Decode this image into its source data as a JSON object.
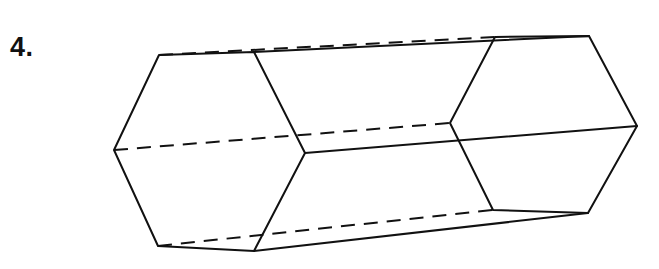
{
  "label": {
    "problem_number": "4."
  },
  "figure": {
    "type": "hexagonal-prism",
    "stroke_color": "#111111",
    "front_hexagon": [
      [
        159,
        55
      ],
      [
        254,
        52
      ],
      [
        305,
        153
      ],
      [
        254,
        251
      ],
      [
        158,
        246
      ],
      [
        114,
        150
      ]
    ],
    "back_hexagon": [
      [
        495,
        37
      ],
      [
        589,
        36
      ],
      [
        637,
        126
      ],
      [
        588,
        213
      ],
      [
        493,
        210
      ],
      [
        450,
        123
      ]
    ],
    "visible_lateral_edges": [
      [
        [
          254,
          52
        ],
        [
          589,
          36
        ]
      ],
      [
        [
          305,
          153
        ],
        [
          637,
          126
        ]
      ],
      [
        [
          254,
          251
        ],
        [
          588,
          213
        ]
      ]
    ],
    "hidden_lateral_edges": [
      [
        [
          159,
          55
        ],
        [
          495,
          37
        ]
      ],
      [
        [
          114,
          150
        ],
        [
          450,
          123
        ]
      ],
      [
        [
          158,
          246
        ],
        [
          493,
          210
        ]
      ]
    ]
  }
}
